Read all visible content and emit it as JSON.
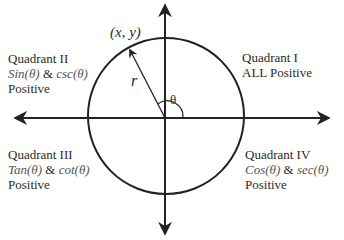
{
  "diagram": {
    "point_label": "(x, y)",
    "radius_label": "r",
    "angle_label": "θ",
    "quadrants": [
      {
        "id": "I",
        "title": "Quadrant I",
        "functions": "",
        "line2": "ALL Positive",
        "line3": ""
      },
      {
        "id": "II",
        "title": "Quadrant II",
        "func1": "Sin(θ)",
        "amp": "&",
        "func2": "csc(θ)",
        "line3": "Positive"
      },
      {
        "id": "III",
        "title": "Quadrant III",
        "func1": "Tan(θ)",
        "amp": "&",
        "func2": "cot(θ)",
        "line3": "Positive"
      },
      {
        "id": "IV",
        "title": "Quadrant IV",
        "func1": "Cos(θ)",
        "amp": "&",
        "func2": "sec(θ)",
        "line3": "Positive"
      }
    ],
    "colors": {
      "stroke": "#222222",
      "text": "#2a2a2a",
      "function_text": "#555555",
      "background": "#ffffff"
    }
  }
}
